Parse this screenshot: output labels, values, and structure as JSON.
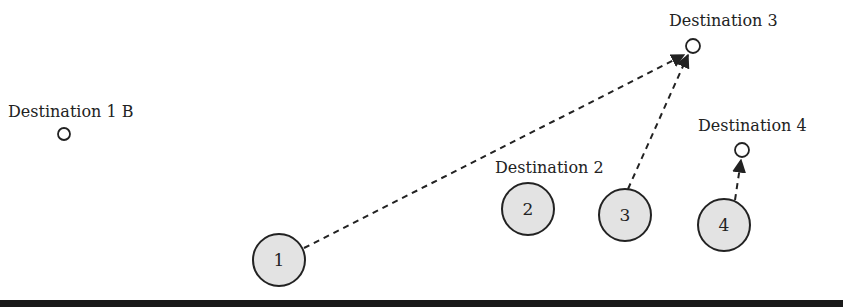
{
  "diagram": {
    "destinations": [
      {
        "id": "dest-1b",
        "label": "Destination 1 B",
        "cx": 64,
        "cy": 134,
        "r": 6,
        "lx": 8,
        "ly": 117
      },
      {
        "id": "dest-2",
        "label": "Destination 2",
        "cx": null,
        "cy": null,
        "r": 0,
        "lx": 495,
        "ly": 173
      },
      {
        "id": "dest-3",
        "label": "Destination 3",
        "cx": 693,
        "cy": 46,
        "r": 7,
        "lx": 669,
        "ly": 26
      },
      {
        "id": "dest-4",
        "label": "Destination 4",
        "cx": 742,
        "cy": 150,
        "r": 7,
        "lx": 698,
        "ly": 131
      }
    ],
    "agents": [
      {
        "id": "agent-1",
        "label": "1",
        "cx": 279,
        "cy": 260,
        "r": 26
      },
      {
        "id": "agent-2",
        "label": "2",
        "cx": 528,
        "cy": 209,
        "r": 26
      },
      {
        "id": "agent-3",
        "label": "3",
        "cx": 625,
        "cy": 215,
        "r": 26
      },
      {
        "id": "agent-4",
        "label": "4",
        "cx": 724,
        "cy": 225,
        "r": 26
      }
    ],
    "paths": [
      {
        "from": "agent-1",
        "to": "dest-3",
        "x1": 304,
        "y1": 248,
        "x2": 684,
        "y2": 55
      },
      {
        "from": "agent-3",
        "to": "dest-3",
        "x1": 628,
        "y1": 189,
        "x2": 688,
        "y2": 55
      },
      {
        "from": "agent-4",
        "to": "dest-4",
        "x1": 735,
        "y1": 200,
        "x2": 741,
        "y2": 160
      }
    ]
  },
  "colors": {
    "agent_fill": "#e3e3e3",
    "stroke": "#222222",
    "bar": "#1a1a1a"
  }
}
